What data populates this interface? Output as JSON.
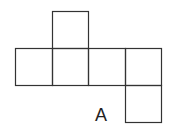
{
  "diagram": {
    "type": "cube-net",
    "stroke_color": "#333333",
    "squares": [
      {
        "id": "top",
        "x": 52,
        "y": 11,
        "w": 36,
        "h": 37
      },
      {
        "id": "row-1",
        "x": 15,
        "y": 48,
        "w": 37,
        "h": 37
      },
      {
        "id": "row-2",
        "x": 52,
        "y": 48,
        "w": 36,
        "h": 37
      },
      {
        "id": "row-3",
        "x": 88,
        "y": 48,
        "w": 37,
        "h": 37
      },
      {
        "id": "row-4",
        "x": 125,
        "y": 48,
        "w": 36,
        "h": 37
      },
      {
        "id": "bottom",
        "x": 125,
        "y": 85,
        "w": 36,
        "h": 37
      }
    ],
    "label": "A"
  }
}
